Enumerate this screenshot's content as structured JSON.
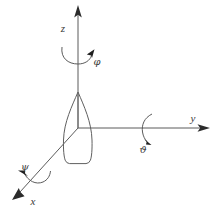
{
  "figure": {
    "kind": "3d-axis-rotation-diagram",
    "background_color": "#ffffff",
    "line_color": "#5b5b5b",
    "label_color": "#3a3a3a",
    "width": 215,
    "height": 215,
    "origin": {
      "x": 78,
      "y": 128
    }
  },
  "axes": [
    {
      "id": "z",
      "label": "z",
      "label_x": 63,
      "label_y": 28,
      "direction": "up",
      "tip": {
        "x": 78,
        "y": 8
      }
    },
    {
      "id": "y",
      "label": "y",
      "label_x": 193,
      "label_y": 122,
      "direction": "right",
      "tip": {
        "x": 208,
        "y": 128
      }
    },
    {
      "id": "x",
      "label": "x",
      "label_x": 33,
      "label_y": 203,
      "direction": "down-left",
      "tip": {
        "x": 12,
        "y": 197
      }
    }
  ],
  "rotations": [
    {
      "id": "phi",
      "label": "φ",
      "about_axis": "z",
      "label_x": 91,
      "label_y": 63
    },
    {
      "id": "theta",
      "label": "ϑ",
      "about_axis": "y",
      "label_x": 142,
      "label_y": 147
    },
    {
      "id": "psi",
      "label": "ψ",
      "about_axis": "x",
      "label_x": 23,
      "label_y": 168
    }
  ],
  "body": {
    "name": "projectile-body",
    "shape": "teardrop",
    "tip": {
      "x": 78,
      "y": 92
    },
    "base_y": 163,
    "max_width": 26
  }
}
